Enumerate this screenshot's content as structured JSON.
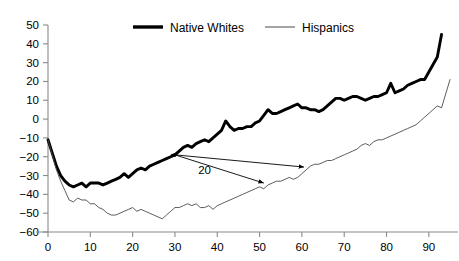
{
  "chart_data": {
    "type": "line",
    "title": "",
    "subtitle": "",
    "xlabel": "",
    "ylabel": "",
    "xlim": [
      0,
      95
    ],
    "ylim": [
      -60,
      50
    ],
    "grid": false,
    "legend_position": "top-center",
    "x_ticks": [
      0,
      10,
      20,
      30,
      40,
      50,
      60,
      70,
      80,
      90
    ],
    "x_tick_labels": [
      "0",
      "10",
      "20",
      "30",
      "40",
      "50",
      "60",
      "70",
      "80",
      "90"
    ],
    "y_ticks": [
      -60,
      -50,
      -40,
      -30,
      -20,
      -10,
      0,
      10,
      20,
      30,
      40,
      50
    ],
    "y_tick_labels": [
      "−60",
      "−50",
      "−40",
      "−30",
      "−20",
      "−10",
      "0",
      "10",
      "20",
      "30",
      "40",
      "50"
    ],
    "series": [
      {
        "name": "Native Whites",
        "style": "thick-solid",
        "color": "#000000",
        "x": [
          0,
          1,
          2,
          3,
          4,
          5,
          6,
          7,
          8,
          9,
          10,
          11,
          12,
          13,
          14,
          15,
          16,
          17,
          18,
          19,
          20,
          21,
          22,
          23,
          24,
          25,
          26,
          27,
          28,
          29,
          30,
          31,
          32,
          33,
          34,
          35,
          36,
          37,
          38,
          39,
          40,
          41,
          42,
          43,
          44,
          45,
          46,
          47,
          48,
          49,
          50,
          51,
          52,
          53,
          54,
          55,
          56,
          57,
          58,
          59,
          60,
          61,
          62,
          63,
          64,
          65,
          66,
          67,
          68,
          69,
          70,
          71,
          72,
          73,
          74,
          75,
          76,
          77,
          78,
          79,
          80,
          81,
          82,
          83,
          84,
          85,
          86,
          87,
          88,
          89,
          90,
          91,
          92,
          93
        ],
        "values": [
          -11,
          -18,
          -25,
          -30,
          -33,
          -35,
          -36,
          -35,
          -34,
          -36,
          -34,
          -34,
          -34,
          -35,
          -34,
          -33,
          -32,
          -31,
          -29,
          -31,
          -29,
          -27,
          -26,
          -27,
          -25,
          -24,
          -23,
          -22,
          -21,
          -20,
          -19,
          -17,
          -15,
          -14,
          -15,
          -13,
          -12,
          -11,
          -12,
          -10,
          -8,
          -6,
          -1,
          -4,
          -6,
          -5,
          -5,
          -4,
          -4,
          -2,
          -1,
          2,
          5,
          3,
          3,
          4,
          5,
          6,
          7,
          8,
          6,
          6,
          5,
          5,
          4,
          5,
          7,
          9,
          11,
          11,
          10,
          11,
          12,
          12,
          11,
          10,
          11,
          12,
          12,
          13,
          14,
          19,
          14,
          15,
          16,
          18,
          19,
          20,
          21,
          21,
          25,
          29,
          33,
          45
        ]
      },
      {
        "name": "Hispanics",
        "style": "thin-solid",
        "color": "#4a4a4a",
        "x": [
          0,
          1,
          2,
          3,
          4,
          5,
          6,
          7,
          8,
          9,
          10,
          11,
          12,
          13,
          14,
          15,
          16,
          17,
          18,
          19,
          20,
          21,
          22,
          23,
          24,
          25,
          26,
          27,
          28,
          29,
          30,
          31,
          32,
          33,
          34,
          35,
          36,
          37,
          38,
          39,
          40,
          41,
          42,
          43,
          44,
          45,
          46,
          47,
          48,
          49,
          50,
          51,
          52,
          53,
          54,
          55,
          56,
          57,
          58,
          59,
          60,
          61,
          62,
          63,
          64,
          65,
          66,
          67,
          68,
          69,
          70,
          71,
          72,
          73,
          74,
          75,
          76,
          77,
          78,
          79,
          80,
          81,
          82,
          83,
          84,
          85,
          86,
          87,
          88,
          89,
          90,
          91,
          92,
          93,
          95
        ],
        "values": [
          -11,
          -19,
          -27,
          -33,
          -38,
          -43,
          -44,
          -42,
          -43,
          -43,
          -45,
          -45,
          -47,
          -48,
          -50,
          -51,
          -51,
          -50,
          -49,
          -48,
          -47,
          -49,
          -48,
          -49,
          -50,
          -51,
          -52,
          -53,
          -51,
          -49,
          -47,
          -47,
          -46,
          -45,
          -46,
          -45,
          -47,
          -47,
          -46,
          -48,
          -46,
          -45,
          -44,
          -43,
          -42,
          -41,
          -40,
          -39,
          -38,
          -37,
          -36,
          -37,
          -35,
          -34,
          -33,
          -33,
          -32,
          -31,
          -32,
          -31,
          -29,
          -27,
          -25,
          -24,
          -24,
          -23,
          -22,
          -22,
          -21,
          -20,
          -19,
          -18,
          -17,
          -16,
          -14,
          -13,
          -14,
          -12,
          -11,
          -11,
          -10,
          -9,
          -8,
          -7,
          -6,
          -5,
          -4,
          -3,
          -1,
          1,
          3,
          5,
          7,
          6,
          21
        ]
      }
    ],
    "annotations": [
      {
        "text": "20",
        "x": 37,
        "y": -29,
        "arrows": [
          {
            "from_x": 30,
            "from_y": -19,
            "to_x": 60.5,
            "to_y": -25.5
          },
          {
            "from_x": 30,
            "from_y": -19,
            "to_x": 51,
            "to_y": -34
          }
        ]
      }
    ]
  },
  "legend": {
    "items": [
      {
        "label": "Native Whites"
      },
      {
        "label": "Hispanics"
      }
    ]
  }
}
